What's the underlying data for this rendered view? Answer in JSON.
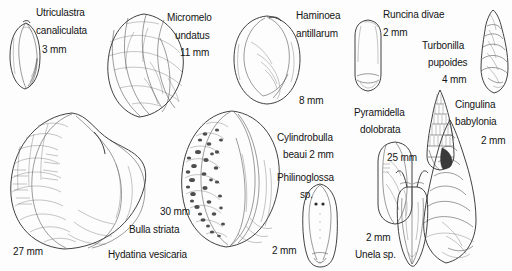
{
  "plate": {
    "title": "Opisthobranch and pyramidellid shell plate",
    "background_color": "#fdfdfd",
    "ink_color": "#2b2b2b",
    "width": 512,
    "height": 271
  },
  "specimens": [
    {
      "id": "utriculastra",
      "genus": "Utriculastra",
      "species": "canaliculata",
      "size": "3 mm",
      "label_lines": [
        "Utriculastra",
        "canaliculata",
        "3 mm"
      ],
      "figure_name": "utriculastra-canaliculata-shell"
    },
    {
      "id": "micromelo",
      "genus": "Micromelo",
      "species": "undatus",
      "size": "11 mm",
      "label_lines": [
        "Micromelo",
        "undatus",
        "11 mm"
      ],
      "figure_name": "micromelo-undatus-shell"
    },
    {
      "id": "haminoea",
      "genus": "Haminoea",
      "species": "antillarum",
      "size": "8 mm",
      "label_lines": [
        "Haminoea",
        "antillarum"
      ],
      "size_label": "8 mm",
      "figure_name": "haminoea-antillarum-shell"
    },
    {
      "id": "runcina",
      "genus": "Runcina",
      "species": "divae",
      "size": "2 mm",
      "label_lines": [
        "Runcina divae",
        "2 mm"
      ],
      "figure_name": "runcina-divae-body"
    },
    {
      "id": "turbonilla",
      "genus": "Turbonilla",
      "species": "pupoides",
      "size": "4 mm",
      "label_lines": [
        "Turbonilla",
        "pupoides",
        "4 mm"
      ],
      "figure_name": "turbonilla-pupoides-shell"
    },
    {
      "id": "cingulina",
      "genus": "Cingulina",
      "species": "babylonia",
      "size": "2 mm",
      "label_lines": [
        "Cingulina",
        "babylonia"
      ],
      "size_label": "2 mm",
      "figure_name": "cingulina-babylonia-shell"
    },
    {
      "id": "pyramidella",
      "genus": "Pyramidella",
      "species": "dolobrata",
      "size": "25 mm",
      "label_lines": [
        "Pyramidella",
        "dolobrata"
      ],
      "size_label": "25 mm",
      "figure_name": "pyramidella-dolobrata-shell"
    },
    {
      "id": "cylindrobulla",
      "genus": "Cylindrobulla",
      "species": "beaui",
      "size": "2 mm",
      "label_lines": [
        "Cylindrobulla",
        "beaui  2 mm"
      ],
      "figure_name": "cylindrobulla-beaui-shell"
    },
    {
      "id": "philinoglossa",
      "genus": "Philinoglossa",
      "species": "sp.",
      "size": "2 mm",
      "label_lines": [
        "Philinoglossa",
        "sp."
      ],
      "size_label": "2 mm",
      "figure_name": "philinoglossa-body"
    },
    {
      "id": "unela",
      "genus": "Unela",
      "species": "sp.",
      "size": "2 mm",
      "label_lines": [
        "Unela sp."
      ],
      "size_label": "2 mm",
      "figure_name": "unela-body"
    },
    {
      "id": "bulla",
      "genus": "Bulla",
      "species": "striata",
      "size": "30 mm",
      "label_lines": [
        "Bulla striata"
      ],
      "size_label": "30 mm",
      "figure_name": "bulla-striata-shell"
    },
    {
      "id": "hydatina",
      "genus": "Hydatina",
      "species": "vesicaria",
      "size": "27 mm",
      "label_lines": [
        "Hydatina vesicaria"
      ],
      "size_label": "27 mm",
      "figure_name": "hydatina-vesicaria-shell"
    }
  ],
  "labels": {
    "utriculastra_l1": "Utriculastra",
    "utriculastra_l2": "canaliculata",
    "utriculastra_size": "3 mm",
    "micromelo_l1": "Micromelo",
    "micromelo_l2": "undatus",
    "micromelo_size": "11 mm",
    "haminoea_l1": "Haminoea",
    "haminoea_l2": "antillarum",
    "haminoea_size": "8 mm",
    "runcina_l1": "Runcina divae",
    "runcina_size": "2 mm",
    "turbonilla_l1": "Turbonilla",
    "turbonilla_l2": "pupoides",
    "turbonilla_size": "4 mm",
    "cingulina_l1": "Cingulina",
    "cingulina_l2": "babylonia",
    "cingulina_size": "2 mm",
    "pyramidella_l1": "Pyramidella",
    "pyramidella_l2": "dolobrata",
    "pyramidella_size": "25 mm",
    "cylindrobulla_l1": "Cylindrobulla",
    "cylindrobulla_l2": "beaui  2 mm",
    "philinoglossa_l1": "Philinoglossa",
    "philinoglossa_l2": "sp.",
    "philinoglossa_size": "2 mm",
    "unela_l1": "Unela sp.",
    "unela_size": "2 mm",
    "bulla_size": "30 mm",
    "bulla_l1": "Bulla striata",
    "hydatina_size": "27 mm",
    "hydatina_l1": "Hydatina vesicaria"
  }
}
